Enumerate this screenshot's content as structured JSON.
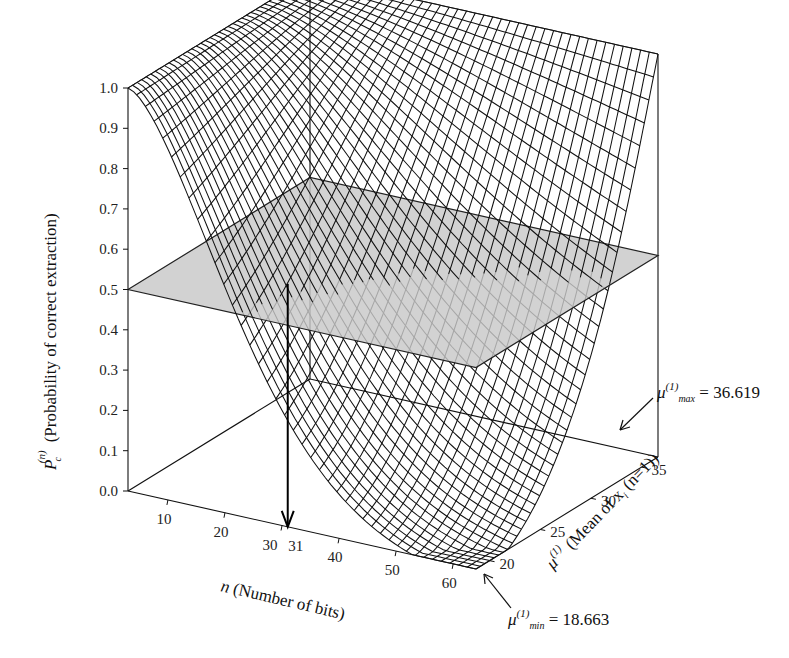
{
  "chart_data": {
    "type": "surface3d",
    "title": "",
    "z_axis": {
      "label": "P_c^(n) (Probability of correct extraction)",
      "label_symbol": "P",
      "label_sub": "c",
      "label_sup": "(n)",
      "label_text": "(Probability of correct extraction)",
      "range": [
        0.0,
        1.0
      ],
      "ticks": [
        0.0,
        0.1,
        0.2,
        0.3,
        0.4,
        0.5,
        0.6,
        0.7,
        0.8,
        0.9,
        1.0
      ],
      "tick_labels": [
        "0.0",
        "0.1",
        "0.2",
        "0.3",
        "0.4",
        "0.5",
        "0.6",
        "0.7",
        "0.8",
        "0.9",
        "1.0"
      ]
    },
    "x_axis": {
      "label": "n (Number of bits)",
      "label_symbol": "n",
      "label_text": "(Number of bits)",
      "range": [
        3,
        64
      ],
      "ticks": [
        10,
        20,
        30,
        31,
        40,
        50,
        60
      ],
      "tick_labels": [
        "10",
        "20",
        "30",
        "31",
        "40",
        "50",
        "60"
      ]
    },
    "y_axis": {
      "label": "μ^(1) (Mean of x_i (n=1))",
      "label_symbol": "μ",
      "label_sup": "(1)",
      "label_text": "(Mean of x",
      "label_sub": "i",
      "label_tail": " (n=1))",
      "range": [
        18.663,
        36.619
      ],
      "ticks": [
        20,
        25,
        30,
        35
      ],
      "tick_labels": [
        "20",
        "25",
        "30",
        "35"
      ]
    },
    "threshold_plane": {
      "z": 0.5,
      "color": "#c8c8c8"
    },
    "highlight": {
      "n": 31,
      "label": "31",
      "arrow": "from threshold intersection down to n-axis"
    },
    "annotations": [
      {
        "symbol": "μ",
        "sup": "(1)",
        "sub": "max",
        "text": " = 36.619",
        "value": 36.619
      },
      {
        "symbol": "μ",
        "sup": "(1)",
        "sub": "min",
        "text": " = 18.663",
        "value": 18.663
      }
    ],
    "surface_description": "P ≈ 1.0 for small n across all μ; dips toward 0 for large n at low μ (minimum near n=64, μ=18.663); remains near 1 at high μ",
    "mesh": {
      "n_lines": 40,
      "mu_lines": 40,
      "color": "#111111"
    },
    "grid": false,
    "legend": null
  }
}
